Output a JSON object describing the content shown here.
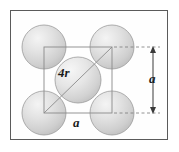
{
  "figure": {
    "frame": {
      "x": 10,
      "y": 10,
      "width": 158,
      "height": 130,
      "border_color": "#5a5a5a"
    },
    "colors": {
      "sphere_fill": "#d4d4d4",
      "sphere_highlight": "#f2f2f2",
      "sphere_edge": "#9a9a9a",
      "cell_line": "#8a8a8a",
      "diagonal_line": "#8a8a8a",
      "dimension_line": "#3a3a3a",
      "dashed_line": "#7a7a7a",
      "background": "#fefefe",
      "text": "#1a1a1a"
    },
    "labels": {
      "diagonal": "4r",
      "edge_vertical": "a",
      "edge_horizontal": "a"
    },
    "unit_cell": {
      "x": 44,
      "y": 47,
      "size": 68
    },
    "atoms": [
      {
        "name": "atom-top-left",
        "cx": 44,
        "cy": 47,
        "r": 22
      },
      {
        "name": "atom-top-right",
        "cx": 112,
        "cy": 47,
        "r": 22
      },
      {
        "name": "atom-bottom-left",
        "cx": 44,
        "cy": 113,
        "r": 22
      },
      {
        "name": "atom-bottom-right",
        "cx": 112,
        "cy": 113,
        "r": 22
      },
      {
        "name": "atom-center",
        "cx": 78,
        "cy": 80,
        "r": 23
      }
    ],
    "dimension": {
      "vertical_arrow_x": 153,
      "vertical_arrow_top": 47,
      "vertical_arrow_bottom": 113,
      "dashed_top_y": 47,
      "dashed_bottom_y": 113
    }
  }
}
